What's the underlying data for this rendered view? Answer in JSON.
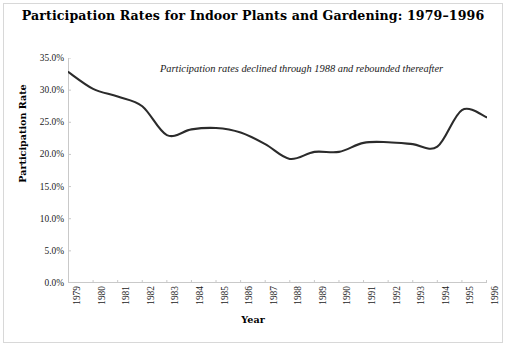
{
  "chart_data": {
    "type": "line",
    "title": "Participation Rates for Indoor Plants and Gardening: 1979–1996",
    "annotation": "Participation rates declined through 1988 and rebounded thereafter",
    "xlabel": "Year",
    "ylabel": "Participation Rate",
    "categories": [
      "1979",
      "1980",
      "1981",
      "1982",
      "1983",
      "1984",
      "1985",
      "1986",
      "1987",
      "1988",
      "1989",
      "1990",
      "1991",
      "1992",
      "1993",
      "1994",
      "1995",
      "1996"
    ],
    "values": [
      32.8,
      30.2,
      29.0,
      27.5,
      23.0,
      23.9,
      24.1,
      23.4,
      21.6,
      19.3,
      20.4,
      20.4,
      21.8,
      21.9,
      21.6,
      21.2,
      26.9,
      25.8
    ],
    "x": [
      1979,
      1980,
      1981,
      1982,
      1983,
      1984,
      1985,
      1986,
      1987,
      1988,
      1989,
      1990,
      1991,
      1992,
      1993,
      1994,
      1995,
      1996
    ],
    "ylim": [
      0,
      35
    ],
    "ytick_values": [
      0,
      5,
      10,
      15,
      20,
      25,
      30,
      35
    ],
    "ytick_labels": [
      "0.0%",
      "5.0%",
      "10.0%",
      "15.0%",
      "20.0%",
      "25.0%",
      "30.0%",
      "35.0%"
    ],
    "xtick_labels": [
      "1979",
      "1980",
      "1981",
      "1982",
      "1983",
      "1984",
      "1985",
      "1986",
      "1987",
      "1988",
      "1989",
      "1990",
      "1991",
      "1992",
      "1993",
      "1994",
      "1995",
      "1996"
    ],
    "grid": false,
    "legend": "none",
    "series": [
      {
        "name": "Participation Rate",
        "values": [
          32.8,
          30.2,
          29.0,
          27.5,
          23.0,
          23.9,
          24.1,
          23.4,
          21.6,
          19.3,
          20.4,
          20.4,
          21.8,
          21.9,
          21.6,
          21.2,
          26.9,
          25.8
        ],
        "color": "#2b2b2b",
        "line_width": 2.1,
        "smoothing": "spline",
        "markers": "none"
      }
    ],
    "line_color": "#2b2b2b",
    "axis_color": "#c9c9c9",
    "background_color": "#ffffff",
    "border_color": "#d8d8d8"
  }
}
